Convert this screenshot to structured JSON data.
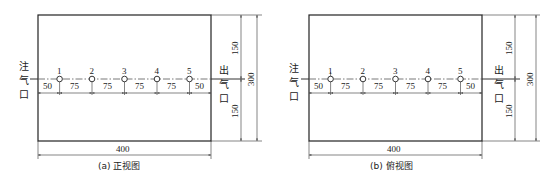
{
  "views": [
    {
      "id": "a",
      "caption": "(a) 正视图",
      "inlet_label": [
        "注",
        "气",
        "口"
      ],
      "outlet_label": [
        "出",
        "气",
        "口"
      ],
      "holes": [
        "1",
        "2",
        "3",
        "4",
        "5"
      ],
      "spacing": [
        "50",
        "75",
        "75",
        "75",
        "75",
        "50"
      ],
      "width_dim": "400",
      "height_dim": "300",
      "upper_dim": "150",
      "lower_dim": "150"
    },
    {
      "id": "b",
      "caption": "(b) 俯视图",
      "inlet_label": [
        "注",
        "气",
        "口"
      ],
      "outlet_label": [
        "出",
        "气",
        "口"
      ],
      "holes": [
        "1",
        "2",
        "3",
        "4",
        "5"
      ],
      "spacing": [
        "50",
        "75",
        "75",
        "75",
        "75",
        "50"
      ],
      "width_dim": "400",
      "height_dim": "300",
      "upper_dim": "150",
      "lower_dim": "150"
    }
  ]
}
